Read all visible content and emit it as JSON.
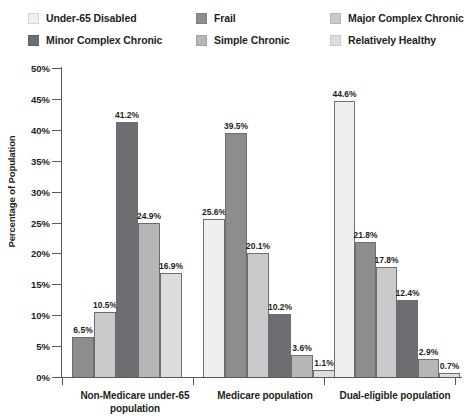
{
  "legend": {
    "items": [
      {
        "label": "Under-65 Disabled",
        "color": "#efefef",
        "col": 0,
        "row": 0
      },
      {
        "label": "Minor Complex Chronic",
        "color": "#6d6e71",
        "col": 0,
        "row": 1
      },
      {
        "label": "Frail",
        "color": "#8c8d8f",
        "col": 1,
        "row": 0
      },
      {
        "label": "Simple Chronic",
        "color": "#b5b6b8",
        "col": 1,
        "row": 1
      },
      {
        "label": "Major Complex Chronic",
        "color": "#c9cacb",
        "col": 2,
        "row": 0
      },
      {
        "label": "Relatively Healthy",
        "color": "#dcdddd",
        "col": 2,
        "row": 1
      }
    ]
  },
  "chart_data": {
    "type": "bar",
    "title": "",
    "xlabel": "",
    "ylabel": "Percentage of Population",
    "ylim": [
      0,
      50
    ],
    "ytick_labels": [
      "0%",
      "5%",
      "10%",
      "15%",
      "20%",
      "25%",
      "30%",
      "35%",
      "40%",
      "45%",
      "50%"
    ],
    "ytick_values": [
      0,
      5,
      10,
      15,
      20,
      25,
      30,
      35,
      40,
      45,
      50
    ],
    "grid": false,
    "legend_position": "top",
    "value_label_suffix": "%",
    "categories": [
      "Non-Medicare under-65 population",
      "Medicare population",
      "Dual-eligible population"
    ],
    "series": [
      {
        "name": "Under-65 Disabled",
        "color": "#efefef",
        "values": [
          null,
          25.6,
          44.6
        ]
      },
      {
        "name": "Frail",
        "color": "#8c8d8f",
        "values": [
          6.5,
          39.5,
          21.8
        ]
      },
      {
        "name": "Major Complex Chronic",
        "color": "#c9cacb",
        "values": [
          10.5,
          20.1,
          17.8
        ]
      },
      {
        "name": "Minor Complex Chronic",
        "color": "#6d6e71",
        "values": [
          41.2,
          10.2,
          12.4
        ]
      },
      {
        "name": "Simple Chronic",
        "color": "#b5b6b8",
        "values": [
          24.9,
          3.6,
          2.9
        ]
      },
      {
        "name": "Relatively Healthy",
        "color": "#dcdddd",
        "values": [
          16.9,
          1.1,
          0.7
        ]
      }
    ],
    "groups": [
      {
        "label_line1": "Non-Medicare under-65",
        "label_line2": "population",
        "bars": [
          {
            "series": "Frail",
            "value": 6.5,
            "label": "6.5%",
            "color": "#8c8d8f"
          },
          {
            "series": "Major Complex Chronic",
            "value": 10.5,
            "label": "10.5%",
            "color": "#c9cacb"
          },
          {
            "series": "Minor Complex Chronic",
            "value": 41.2,
            "label": "41.2%",
            "color": "#6d6e71"
          },
          {
            "series": "Simple Chronic",
            "value": 24.9,
            "label": "24.9%",
            "color": "#b5b6b8"
          },
          {
            "series": "Relatively Healthy",
            "value": 16.9,
            "label": "16.9%",
            "color": "#dcdddd"
          }
        ]
      },
      {
        "label_line1": "Medicare population",
        "label_line2": "",
        "bars": [
          {
            "series": "Under-65 Disabled",
            "value": 25.6,
            "label": "25.6%",
            "color": "#efefef"
          },
          {
            "series": "Frail",
            "value": 39.5,
            "label": "39.5%",
            "color": "#8c8d8f"
          },
          {
            "series": "Major Complex Chronic",
            "value": 20.1,
            "label": "20.1%",
            "color": "#c9cacb"
          },
          {
            "series": "Minor Complex Chronic",
            "value": 10.2,
            "label": "10.2%",
            "color": "#6d6e71"
          },
          {
            "series": "Simple Chronic",
            "value": 3.6,
            "label": "3.6%",
            "color": "#b5b6b8"
          },
          {
            "series": "Relatively Healthy",
            "value": 1.1,
            "label": "1.1%",
            "color": "#dcdddd"
          }
        ]
      },
      {
        "label_line1": "Dual-eligible population",
        "label_line2": "",
        "bars": [
          {
            "series": "Under-65 Disabled",
            "value": 44.6,
            "label": "44.6%",
            "color": "#efefef"
          },
          {
            "series": "Frail",
            "value": 21.8,
            "label": "21.8%",
            "color": "#8c8d8f"
          },
          {
            "series": "Major Complex Chronic",
            "value": 17.8,
            "label": "17.8%",
            "color": "#c9cacb"
          },
          {
            "series": "Minor Complex Chronic",
            "value": 12.4,
            "label": "12.4%",
            "color": "#6d6e71"
          },
          {
            "series": "Simple Chronic",
            "value": 2.9,
            "label": "2.9%",
            "color": "#b5b6b8"
          },
          {
            "series": "Relatively Healthy",
            "value": 0.7,
            "label": "0.7%",
            "color": "#dcdddd"
          }
        ]
      }
    ]
  }
}
